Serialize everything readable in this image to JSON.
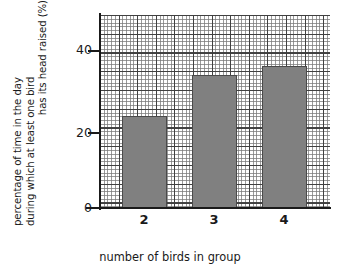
{
  "chart_data": {
    "type": "bar",
    "title": "",
    "categories": [
      "2",
      "3",
      "4"
    ],
    "values": [
      24.5,
      35.5,
      38
    ],
    "xlabel": "number of birds in group",
    "ylabel": "percentage of time in the day during which at least one bird has its head raised (%)",
    "ylabel_lines": [
      "percentage of time in the day",
      "during which at least one bird",
      "has its head raised (%)"
    ],
    "ytick_labels": [
      "0",
      "20",
      "40"
    ],
    "ytick_values": [
      0,
      20,
      40
    ],
    "ylim": [
      0,
      51.5
    ],
    "xlim_categories": 3,
    "grid": true,
    "grid_major_step": 5,
    "grid_minor_step": 1,
    "legend": "none",
    "bar_color": "#808080",
    "bar_edge_color": "#4a4a4a",
    "axis_color": "#1a1a1a",
    "background_color": "#ffffff"
  }
}
